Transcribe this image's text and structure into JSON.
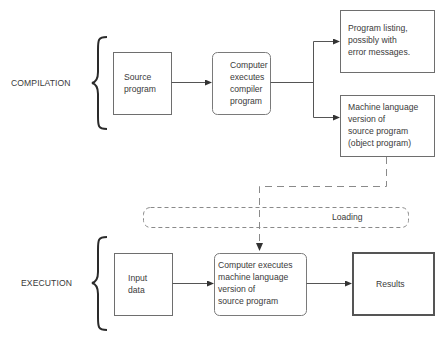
{
  "stages": {
    "compilation": "COMPILATION",
    "execution": "EXECUTION"
  },
  "boxes": {
    "source_program": {
      "lines": [
        "Source",
        "program"
      ]
    },
    "compiler": {
      "lines": [
        "Computer",
        "executes",
        "compiler",
        "program"
      ]
    },
    "listing": {
      "lines": [
        "Program listing,",
        "possibly with",
        "error messages."
      ]
    },
    "object_program": {
      "lines": [
        "Machine language",
        "version of",
        "source program",
        "(object program)"
      ]
    },
    "loading": {
      "text": "Loading"
    },
    "input_data": {
      "lines": [
        "Input",
        "data"
      ]
    },
    "machine_exec": {
      "lines": [
        "Computer executes",
        "machine language",
        "version of",
        "source program"
      ]
    },
    "results": {
      "text": "Results"
    }
  },
  "colors": {
    "stroke": "#6e6e6e",
    "dashed": "#8a8a8a",
    "brace": "#2a2a2a",
    "results_border": "#555555"
  }
}
